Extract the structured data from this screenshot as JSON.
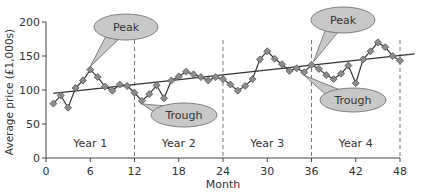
{
  "chart_data": {
    "type": "line",
    "title": "",
    "xlabel": "Month",
    "ylabel": "Average price (£1,000s)",
    "xlim": [
      0,
      48
    ],
    "ylim": [
      0,
      200
    ],
    "x_ticks": [
      "0",
      "6",
      "12",
      "18",
      "24",
      "30",
      "36",
      "42",
      "48"
    ],
    "y_ticks": [
      "0",
      "50",
      "100",
      "150",
      "200"
    ],
    "grid": false,
    "legend": null,
    "series": [
      {
        "name": "Average price",
        "x": [
          1,
          2,
          3,
          4,
          5,
          6,
          7,
          8,
          9,
          10,
          11,
          12,
          13,
          14,
          15,
          16,
          17,
          18,
          19,
          20,
          21,
          22,
          23,
          24,
          25,
          26,
          27,
          28,
          29,
          30,
          31,
          32,
          33,
          34,
          35,
          36,
          37,
          38,
          39,
          40,
          41,
          42,
          43,
          44,
          45,
          46,
          47,
          48
        ],
        "values": [
          80,
          92,
          74,
          103,
          114,
          130,
          119,
          105,
          99,
          108,
          106,
          96,
          84,
          94,
          107,
          88,
          114,
          120,
          127,
          123,
          119,
          114,
          119,
          116,
          108,
          99,
          106,
          116,
          145,
          157,
          146,
          138,
          128,
          132,
          126,
          137,
          131,
          122,
          116,
          124,
          136,
          110,
          145,
          157,
          170,
          163,
          150,
          143
        ]
      },
      {
        "name": "Trend",
        "x": [
          1,
          50
        ],
        "values": [
          95,
          153
        ]
      }
    ],
    "dividers": [
      12,
      24,
      36,
      48
    ],
    "period_labels": [
      {
        "label": "Year 1",
        "x": 6
      },
      {
        "label": "Year 2",
        "x": 18
      },
      {
        "label": "Year 3",
        "x": 30
      },
      {
        "label": "Year 4",
        "x": 42
      }
    ],
    "annotations": [
      {
        "label": "Peak",
        "target_x": 6,
        "target_y": 130
      },
      {
        "label": "Trough",
        "target_x": 13,
        "target_y": 84
      },
      {
        "label": "Peak",
        "target_x": 36,
        "target_y": 137
      },
      {
        "label": "Trough",
        "target_x": 35,
        "target_y": 126
      }
    ]
  },
  "colors": {
    "line": "#333333",
    "marker_fill": "#8c8c8c",
    "marker_stroke": "#555555",
    "callout_fill": "#c8c8c8",
    "callout_stroke": "#666666",
    "divider": "#777777"
  }
}
